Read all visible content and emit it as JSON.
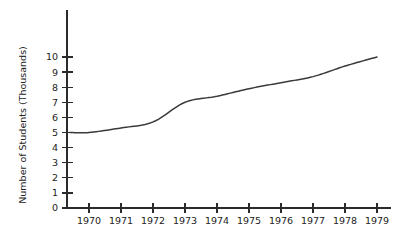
{
  "chart_data": {
    "type": "line",
    "title": "",
    "subtitle": "",
    "xlabel": "",
    "ylabel": "Number of Students (Thousands)",
    "x": [
      1970,
      1971,
      1972,
      1973,
      1974,
      1975,
      1976,
      1977,
      1978,
      1979
    ],
    "categories": [
      "1970",
      "1971",
      "1972",
      "1973",
      "1974",
      "1975",
      "1976",
      "1977",
      "1978",
      "1979"
    ],
    "values": [
      5.0,
      5.3,
      5.7,
      7.0,
      7.4,
      7.9,
      8.3,
      8.7,
      9.4,
      10.0
    ],
    "series": [
      {
        "name": "Number of Students",
        "values": [
          5.0,
          5.3,
          5.7,
          7.0,
          7.4,
          7.9,
          8.3,
          8.7,
          9.4,
          10.0
        ]
      }
    ],
    "start_point": {
      "x": 1969.4,
      "y": 5.0
    },
    "xlim": [
      1969.4,
      1979.0
    ],
    "ylim": [
      0,
      10
    ],
    "ytick_labels": [
      "0",
      "1",
      "2",
      "3",
      "4",
      "5",
      "6",
      "7",
      "8",
      "9",
      "10"
    ],
    "ytick_values": [
      0,
      1,
      2,
      3,
      4,
      5,
      6,
      7,
      8,
      9,
      10
    ],
    "xtick_labels": [
      "1970",
      "1971",
      "1972",
      "1973",
      "1974",
      "1975",
      "1976",
      "1977",
      "1978",
      "1979"
    ],
    "grid": false,
    "legend": "none",
    "line_color": "#3a3a3a",
    "axis_color": "#2b2b2b",
    "background_color": "#ffffff"
  }
}
